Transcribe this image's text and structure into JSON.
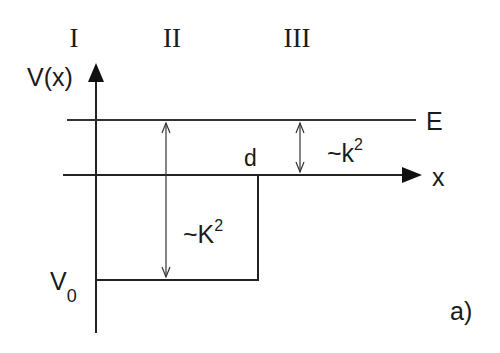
{
  "regions": {
    "r1": "I",
    "r2": "II",
    "r3": "III"
  },
  "axes": {
    "y_label": "V(x)",
    "x_label": "x"
  },
  "labels": {
    "energy": "E",
    "well_width": "d",
    "depth_prefix": "V",
    "depth_sub": "0",
    "inside_wave": "~K",
    "inside_sup": "2",
    "outside_wave": "~k",
    "outside_sup": "2",
    "panel": "a)"
  }
}
